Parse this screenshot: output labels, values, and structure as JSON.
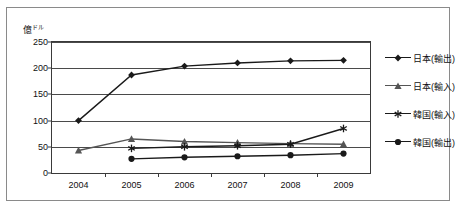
{
  "chart_data": {
    "type": "line",
    "title": "",
    "xlabel": "",
    "ylabel": "億ドル",
    "unit_label_main": "億",
    "unit_label_sub": "ドル",
    "categories": [
      "2004",
      "2005",
      "2006",
      "2007",
      "2008",
      "2009"
    ],
    "x": [
      2004,
      2005,
      2006,
      2007,
      2008,
      2009
    ],
    "ylim": [
      0,
      250
    ],
    "yticks": [
      0,
      50,
      100,
      150,
      200,
      250
    ],
    "ytick_labels": [
      "0",
      "50",
      "100",
      "150",
      "200",
      "250"
    ],
    "grid": true,
    "legend_position": "right",
    "series": [
      {
        "name": "日本(輸出)",
        "marker": "diamond",
        "color": "#1a1a1a",
        "values": [
          100,
          187,
          204,
          210,
          214,
          215
        ]
      },
      {
        "name": "日本(輸入)",
        "marker": "triangle",
        "color": "#555555",
        "values": [
          43,
          65,
          60,
          58,
          56,
          55
        ]
      },
      {
        "name": "韓国(輸入)",
        "marker": "asterisk",
        "color": "#1a1a1a",
        "values": [
          null,
          47,
          50,
          52,
          55,
          85
        ]
      },
      {
        "name": "韓国(輸出)",
        "marker": "circle",
        "color": "#1a1a1a",
        "values": [
          null,
          27,
          30,
          32,
          34,
          37
        ]
      }
    ]
  }
}
